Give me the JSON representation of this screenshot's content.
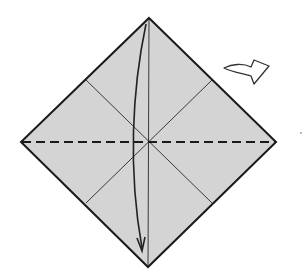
{
  "diagram": {
    "title": "",
    "type": "origami-step",
    "colors": {
      "paper_fill": "#d4d4d4",
      "outline": "#1a1a1a",
      "crease": "#3a3a3a",
      "arrow": "#222222",
      "turn_over_fill": "#ffffff"
    },
    "square": {
      "top": [
        149,
        18
      ],
      "right": [
        276,
        142
      ],
      "bottom": [
        148,
        267
      ],
      "left": [
        21,
        142
      ],
      "center": [
        149,
        142
      ]
    },
    "creases": [
      {
        "name": "vertical-crease",
        "from": [
          149,
          18
        ],
        "to": [
          148,
          267
        ],
        "style": "solid-thin"
      },
      {
        "name": "diagonal-crease-a",
        "from": [
          86,
          80
        ],
        "to": [
          212,
          203
        ],
        "style": "solid-thin"
      },
      {
        "name": "diagonal-crease-b",
        "from": [
          212,
          80
        ],
        "to": [
          86,
          203
        ],
        "style": "solid-thin"
      }
    ],
    "fold_line": {
      "name": "valley-fold-horizontal",
      "from": [
        21,
        142
      ],
      "to": [
        276,
        142
      ],
      "style": "dashed"
    },
    "fold_arrow": {
      "name": "fold-down-arrow",
      "from": [
        146,
        24
      ],
      "to": [
        141,
        250
      ],
      "meaning": "fold top corner down to bottom corner"
    },
    "symbols": [
      {
        "name": "turn-over-icon",
        "meaning": "turn the model over",
        "position": [
          223,
          58
        ]
      }
    ]
  }
}
